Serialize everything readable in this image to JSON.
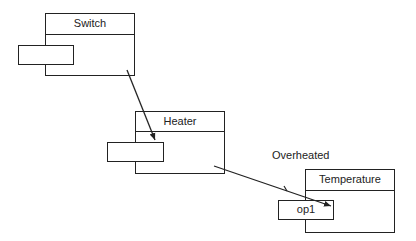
{
  "diagram": {
    "components": [
      {
        "name": "Switch",
        "port_label": ""
      },
      {
        "name": "Heater",
        "port_label": ""
      },
      {
        "name": "Temperature",
        "port_label": "op1"
      }
    ],
    "connections": [
      {
        "from": "Switch",
        "to": "Heater",
        "label": ""
      },
      {
        "from": "Heater",
        "to": "Temperature.op1",
        "label": "Overheated"
      }
    ]
  }
}
